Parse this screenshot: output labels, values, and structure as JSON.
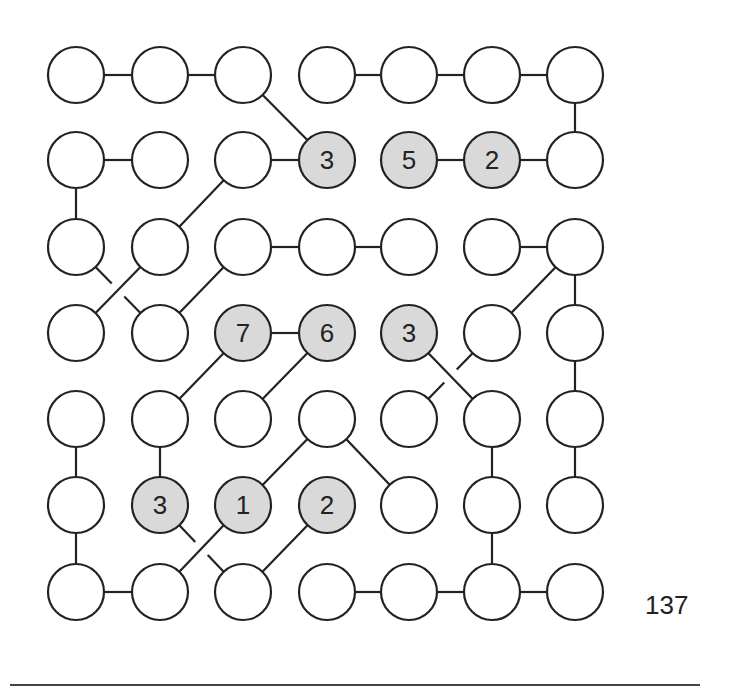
{
  "puzzle": {
    "type": "hashi-like link puzzle",
    "rows": 7,
    "cols": 7,
    "row_y": [
      75,
      160,
      247,
      333,
      419,
      505,
      592
    ],
    "col_x": [
      76,
      160,
      243,
      327,
      409,
      492,
      575
    ],
    "radius": 28,
    "colors": {
      "stroke": "#222222",
      "filled": "#d9d9d9",
      "empty": "#ffffff"
    },
    "numbered_nodes": [
      {
        "r": 2,
        "c": 4,
        "value": "3"
      },
      {
        "r": 2,
        "c": 5,
        "value": "5"
      },
      {
        "r": 2,
        "c": 6,
        "value": "2"
      },
      {
        "r": 4,
        "c": 3,
        "value": "7"
      },
      {
        "r": 4,
        "c": 4,
        "value": "6"
      },
      {
        "r": 4,
        "c": 5,
        "value": "3"
      },
      {
        "r": 6,
        "c": 2,
        "value": "3"
      },
      {
        "r": 6,
        "c": 3,
        "value": "1"
      },
      {
        "r": 6,
        "c": 4,
        "value": "2"
      }
    ],
    "edges": [
      [
        1,
        1,
        1,
        2,
        false
      ],
      [
        1,
        2,
        1,
        3,
        false
      ],
      [
        1,
        3,
        2,
        4,
        false
      ],
      [
        1,
        4,
        1,
        5,
        false
      ],
      [
        1,
        5,
        1,
        6,
        false
      ],
      [
        1,
        6,
        1,
        7,
        false
      ],
      [
        1,
        7,
        2,
        7,
        false
      ],
      [
        2,
        1,
        2,
        2,
        false
      ],
      [
        2,
        1,
        3,
        1,
        false
      ],
      [
        2,
        3,
        2,
        4,
        false
      ],
      [
        2,
        3,
        3,
        2,
        false
      ],
      [
        3,
        2,
        4,
        1,
        false
      ],
      [
        2,
        5,
        2,
        6,
        false
      ],
      [
        2,
        6,
        2,
        7,
        false
      ],
      [
        3,
        1,
        4,
        2,
        true
      ],
      [
        4,
        2,
        3,
        3,
        false
      ],
      [
        3,
        3,
        3,
        4,
        false
      ],
      [
        3,
        4,
        3,
        5,
        false
      ],
      [
        3,
        6,
        3,
        7,
        false
      ],
      [
        3,
        7,
        4,
        6,
        false
      ],
      [
        3,
        7,
        4,
        7,
        false
      ],
      [
        4,
        3,
        4,
        4,
        false
      ],
      [
        4,
        3,
        5,
        2,
        false
      ],
      [
        4,
        4,
        5,
        3,
        false
      ],
      [
        4,
        5,
        5,
        6,
        false
      ],
      [
        4,
        6,
        5,
        5,
        true
      ],
      [
        4,
        7,
        5,
        7,
        false
      ],
      [
        5,
        7,
        6,
        7,
        false
      ],
      [
        5,
        1,
        6,
        1,
        false
      ],
      [
        6,
        1,
        7,
        1,
        false
      ],
      [
        7,
        1,
        7,
        2,
        false
      ],
      [
        5,
        2,
        6,
        2,
        false
      ],
      [
        5,
        4,
        6,
        3,
        false
      ],
      [
        5,
        4,
        6,
        5,
        false
      ],
      [
        5,
        6,
        6,
        6,
        false
      ],
      [
        6,
        6,
        7,
        6,
        false
      ],
      [
        6,
        2,
        7,
        3,
        true
      ],
      [
        6,
        3,
        7,
        2,
        false
      ],
      [
        6,
        4,
        7,
        3,
        false
      ],
      [
        7,
        4,
        7,
        5,
        false
      ],
      [
        7,
        5,
        7,
        6,
        false
      ],
      [
        7,
        6,
        7,
        7,
        false
      ]
    ]
  },
  "page_number": "137"
}
